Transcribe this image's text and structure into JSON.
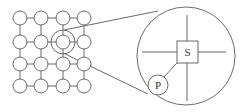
{
  "diagram": {
    "title": "",
    "grid": {
      "rows": 4,
      "cols": 4,
      "x": [
        20,
        41,
        63,
        84
      ],
      "y": [
        18,
        42,
        64,
        86
      ],
      "node_radius": 7,
      "highlighted_node": {
        "row": 1,
        "col": 2,
        "outer_radius": 12
      }
    },
    "zoom_view": {
      "center": [
        186,
        56
      ],
      "radius": 49,
      "square_label": "S",
      "circle_label": "P"
    },
    "colors": {
      "stroke": "#6b6b6b",
      "background": "#ffffff",
      "text": "#333333"
    }
  }
}
